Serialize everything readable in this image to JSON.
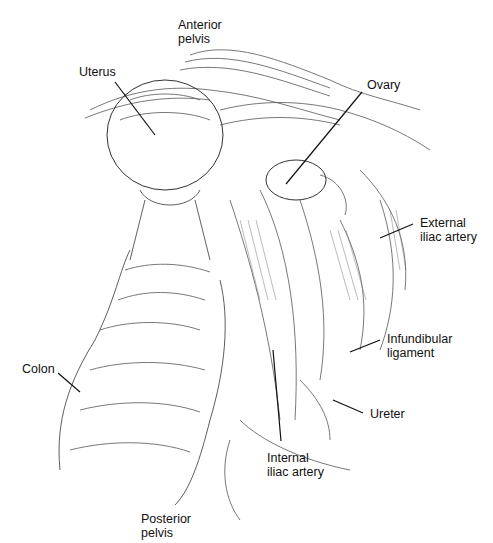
{
  "figure": {
    "type": "anatomical line drawing",
    "labels": {
      "anterior_pelvis": {
        "line1": "Anterior",
        "line2": "pelvis"
      },
      "uterus": {
        "line1": "Uterus"
      },
      "ovary": {
        "line1": "Ovary"
      },
      "external_iliac_artery": {
        "line1": "External",
        "line2": "iliac artery"
      },
      "infundibular_ligament": {
        "line1": "Infundibular",
        "line2": "ligament"
      },
      "ureter": {
        "line1": "Ureter"
      },
      "colon": {
        "line1": "Colon"
      },
      "internal_iliac_artery": {
        "line1": "Internal",
        "line2": "iliac artery"
      },
      "posterior_pelvis": {
        "line1": "Posterior",
        "line2": "pelvis"
      }
    },
    "colors": {
      "ink": "#111111",
      "hatch": "#555555",
      "background": "#ffffff"
    }
  }
}
